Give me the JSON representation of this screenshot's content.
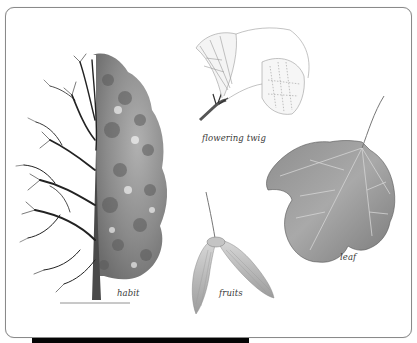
{
  "figure": {
    "labels": {
      "twig": "flowering twig",
      "leaf": "leaf",
      "habit": "habit",
      "fruits": "fruits"
    },
    "colors": {
      "background": "#ffffff",
      "frame_border": "#8a8a8a",
      "ink": "#2a2a2a",
      "leaf_fill": "#9a9a9a",
      "bar": "#050505"
    }
  }
}
